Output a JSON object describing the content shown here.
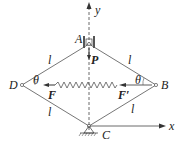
{
  "diagram": {
    "points": {
      "A": {
        "label": "A",
        "x": 89,
        "y": 44
      },
      "B": {
        "label": "B",
        "x": 156,
        "y": 85
      },
      "C": {
        "label": "C",
        "x": 89,
        "y": 126
      },
      "D": {
        "label": "D",
        "x": 22,
        "y": 85
      }
    },
    "axes": {
      "x_label": "x",
      "y_label": "y"
    },
    "members": {
      "length_label": "l"
    },
    "angle_label": "θ",
    "forces": {
      "P": "P",
      "F": "F",
      "F_prime": "F′"
    },
    "colors": {
      "line": "#555555",
      "text": "#222222"
    }
  }
}
